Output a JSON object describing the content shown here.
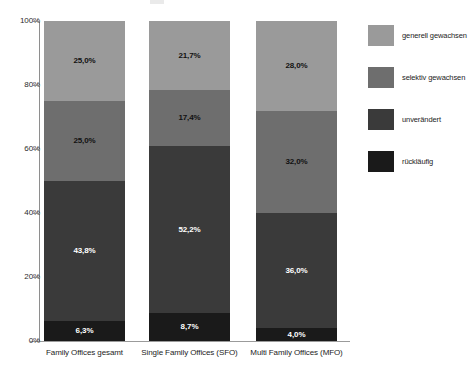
{
  "chart_data": {
    "type": "bar",
    "subtype": "stacked-percentage",
    "title": "",
    "xlabel": "",
    "ylabel": "",
    "ylim": [
      0,
      100
    ],
    "grid": false,
    "legend_position": "right",
    "value_format": "de-DE percent with comma decimal",
    "categories": [
      "Family Offices gesamt",
      "Single Family Offices (SFO)",
      "Multi Family Offices (MFO)"
    ],
    "y_ticks": [
      "0%",
      "20%",
      "40%",
      "60%",
      "80%",
      "100%"
    ],
    "y_tick_values": [
      0,
      20,
      40,
      60,
      80,
      100
    ],
    "stack_order_bottom_to_top": [
      "rückläufig",
      "unverändert",
      "selektiv gewachsen",
      "generell gewachsen"
    ],
    "series": [
      {
        "name": "generell gewachsen",
        "color": "#9a9a9a",
        "label_color": "dark",
        "values": [
          25.0,
          21.7,
          28.0
        ],
        "labels": [
          "25,0%",
          "21,7%",
          "28,0%"
        ]
      },
      {
        "name": "selektiv gewachsen",
        "color": "#6e6e6e",
        "label_color": "dark",
        "values": [
          25.0,
          17.4,
          32.0
        ],
        "labels": [
          "25,0%",
          "17,4%",
          "32,0%"
        ]
      },
      {
        "name": "unverändert",
        "color": "#3a3a3a",
        "label_color": "light",
        "values": [
          43.8,
          52.2,
          36.0
        ],
        "labels": [
          "43,8%",
          "52,2%",
          "36,0%"
        ]
      },
      {
        "name": "rückläufig",
        "color": "#1a1a1a",
        "label_color": "light",
        "values": [
          6.3,
          8.7,
          4.0
        ],
        "labels": [
          "6,3%",
          "8,7%",
          "4,0%"
        ]
      }
    ]
  },
  "legend": {
    "items": [
      {
        "label": "generell gewachsen",
        "color": "#9a9a9a"
      },
      {
        "label": "selektiv gewachsen",
        "color": "#6e6e6e"
      },
      {
        "label": "unverändert",
        "color": "#3a3a3a"
      },
      {
        "label": "rückläufig",
        "color": "#1a1a1a"
      }
    ]
  },
  "axis": {
    "y_ticks": [
      "100%",
      "80%",
      "60%",
      "40%",
      "20%",
      "0%"
    ]
  }
}
